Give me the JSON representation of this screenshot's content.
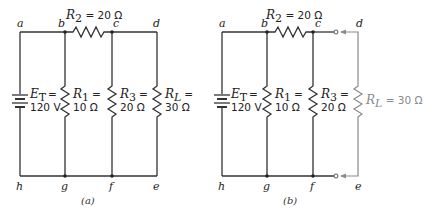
{
  "diagram_a": {
    "caption": "(a)",
    "nodes": {
      "a": "a",
      "b": "b",
      "c": "c",
      "d": "d",
      "e": "e",
      "f": "f",
      "g": "g",
      "h": "h"
    },
    "source": {
      "name": "E",
      "sub": "T",
      "eq": "=",
      "value": "120 V"
    },
    "r2": {
      "name": "R",
      "sub": "2",
      "rest": " = 20 Ω"
    },
    "r1": {
      "name": "R",
      "sub": "1",
      "eq": "=",
      "value": "10 Ω"
    },
    "r3": {
      "name": "R",
      "sub": "3",
      "eq": "=",
      "value": "20 Ω"
    },
    "rl": {
      "name": "R",
      "sub": "L",
      "eq": "=",
      "value": "30 Ω"
    }
  },
  "diagram_b": {
    "caption": "(b)",
    "nodes": {
      "a": "a",
      "b": "b",
      "c": "c",
      "d": "d",
      "e": "e",
      "f": "f",
      "g": "g",
      "h": "h"
    },
    "source": {
      "name": "E",
      "sub": "T",
      "eq": "=",
      "value": "120 V"
    },
    "r2": {
      "name": "R",
      "sub": "2",
      "rest": " = 20 Ω"
    },
    "r1": {
      "name": "R",
      "sub": "1",
      "eq": "=",
      "value": "10 Ω"
    },
    "r3": {
      "name": "R",
      "sub": "3",
      "eq": "=",
      "value": "20 Ω"
    },
    "rl": {
      "name": "R",
      "sub": "L",
      "rest": " = 30 Ω",
      "detached": true
    }
  }
}
